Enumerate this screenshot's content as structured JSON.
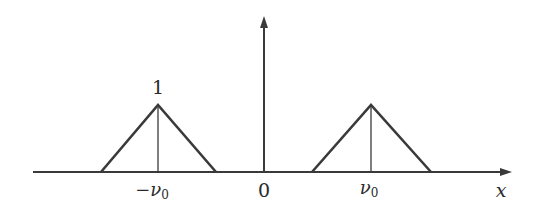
{
  "diagram": {
    "colors": {
      "stroke": "#3a3a3a",
      "background": "#ffffff"
    },
    "axes": {
      "x_label": "x",
      "origin_label": "0"
    },
    "peak_label": "1",
    "ticks": {
      "left": "−ν",
      "left_sub": "0",
      "right": "ν",
      "right_sub": "0"
    },
    "pulses": [
      {
        "center": "-nu0",
        "height": 1,
        "shape": "triangle"
      },
      {
        "center": "nu0",
        "height": 1,
        "shape": "triangle"
      }
    ]
  }
}
